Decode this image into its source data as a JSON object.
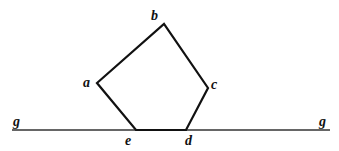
{
  "diagram": {
    "line": {
      "label_left": "g",
      "label_right": "g",
      "x1": 12,
      "x2": 330,
      "y": 130
    },
    "pentagon": {
      "vertices": [
        {
          "name": "a",
          "x": 97,
          "y": 83
        },
        {
          "name": "b",
          "x": 164,
          "y": 24
        },
        {
          "name": "c",
          "x": 208,
          "y": 88
        },
        {
          "name": "d",
          "x": 186,
          "y": 130
        },
        {
          "name": "e",
          "x": 136,
          "y": 130
        }
      ]
    },
    "labels": {
      "a": "a",
      "b": "b",
      "c": "c",
      "d": "d",
      "e": "e"
    },
    "colors": {
      "stroke": "#111111",
      "line": "#333333"
    }
  }
}
